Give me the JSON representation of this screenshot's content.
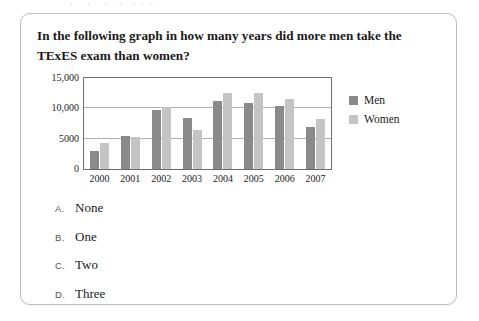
{
  "question": {
    "text": "In the following graph in how many years did more men take the TExES exam than women?"
  },
  "options": [
    {
      "letter": "A.",
      "text": "None"
    },
    {
      "letter": "B.",
      "text": "One"
    },
    {
      "letter": "C.",
      "text": "Two"
    },
    {
      "letter": "D.",
      "text": "Three"
    }
  ],
  "colors": {
    "men": "#8a8a8a",
    "women": "#c4c4c4",
    "frame": "#6e6e6e",
    "gridline": "#b0b0b0",
    "card_border": "#bdbdbd"
  },
  "chart_data": {
    "type": "bar",
    "title": "",
    "xlabel": "",
    "ylabel": "",
    "categories": [
      "2000",
      "2001",
      "2002",
      "2003",
      "2004",
      "2005",
      "2006",
      "2007"
    ],
    "series": [
      {
        "name": "Men",
        "color": "#8a8a8a",
        "values": [
          2900,
          5500,
          9800,
          8400,
          11200,
          10900,
          10400,
          7000
        ]
      },
      {
        "name": "Women",
        "color": "#c4c4c4",
        "values": [
          4300,
          5200,
          10300,
          6500,
          12600,
          12500,
          11500,
          8200
        ]
      }
    ],
    "ylim": [
      0,
      15000
    ],
    "yticks": [
      0,
      5000,
      10000,
      15000
    ],
    "ytick_labels": [
      "0",
      "5000",
      "10,000",
      "15,000"
    ],
    "grid": true,
    "legend_position": "right",
    "legend_entries": [
      "Men",
      "Women"
    ]
  }
}
